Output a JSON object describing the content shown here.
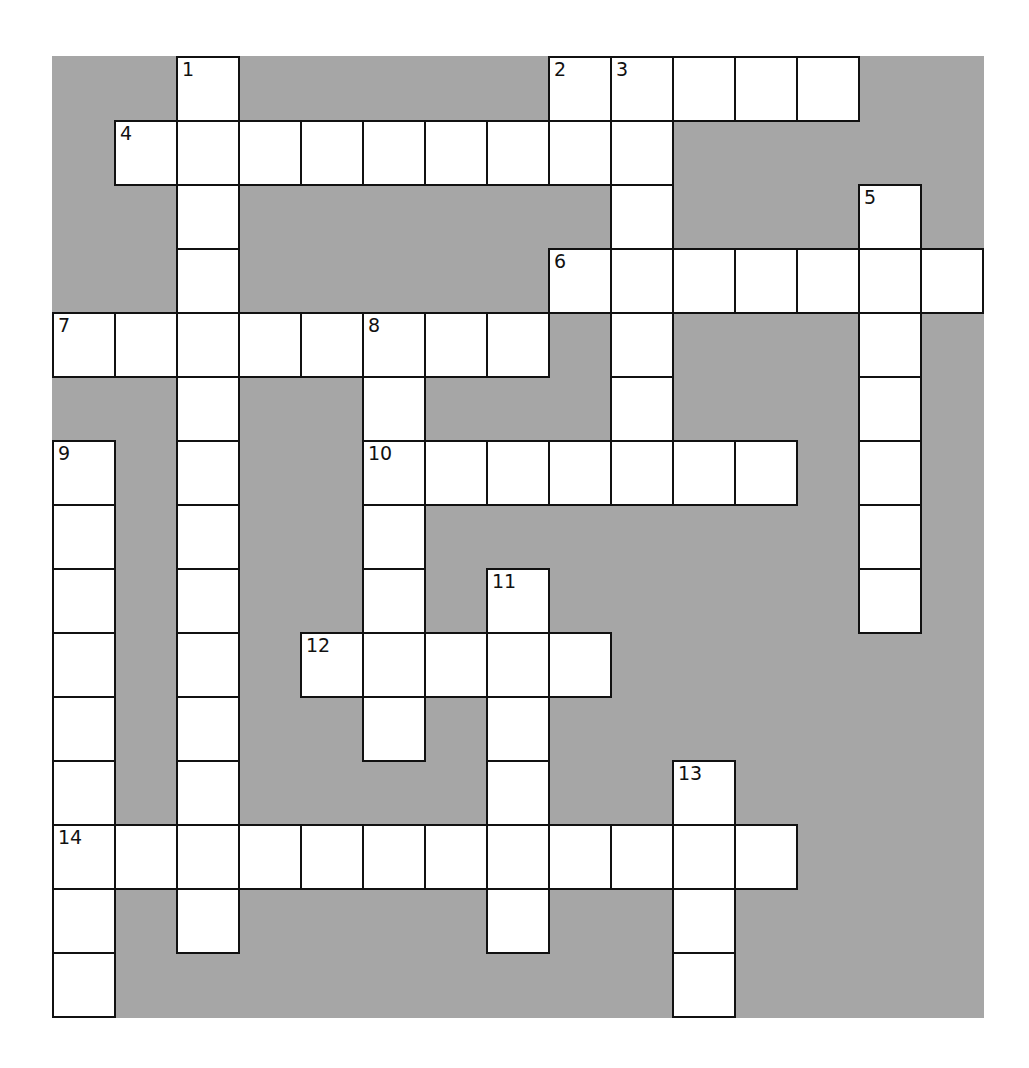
{
  "puzzle": {
    "cols": 15,
    "rows": 15,
    "colors": {
      "block": "#a6a6a6",
      "cell": "#ffffff",
      "border": "#111111"
    },
    "entries": [
      {
        "number": 1,
        "direction": "down",
        "row": 0,
        "col": 2,
        "length": 14
      },
      {
        "number": 2,
        "direction": "across",
        "row": 0,
        "col": 8,
        "length": 5
      },
      {
        "number": 3,
        "direction": "down",
        "row": 0,
        "col": 9,
        "length": 7
      },
      {
        "number": 4,
        "direction": "across",
        "row": 1,
        "col": 1,
        "length": 8
      },
      {
        "number": 5,
        "direction": "down",
        "row": 2,
        "col": 13,
        "length": 7
      },
      {
        "number": 6,
        "direction": "across",
        "row": 3,
        "col": 8,
        "length": 7
      },
      {
        "number": 7,
        "direction": "across",
        "row": 4,
        "col": 0,
        "length": 8
      },
      {
        "number": 8,
        "direction": "down",
        "row": 4,
        "col": 5,
        "length": 7
      },
      {
        "number": 9,
        "direction": "down",
        "row": 6,
        "col": 0,
        "length": 9
      },
      {
        "number": 10,
        "direction": "across",
        "row": 6,
        "col": 5,
        "length": 7
      },
      {
        "number": 11,
        "direction": "down",
        "row": 8,
        "col": 7,
        "length": 6
      },
      {
        "number": 12,
        "direction": "across",
        "row": 9,
        "col": 4,
        "length": 5
      },
      {
        "number": 13,
        "direction": "down",
        "row": 11,
        "col": 10,
        "length": 4
      },
      {
        "number": 14,
        "direction": "across",
        "row": 12,
        "col": 0,
        "length": 12
      }
    ]
  }
}
